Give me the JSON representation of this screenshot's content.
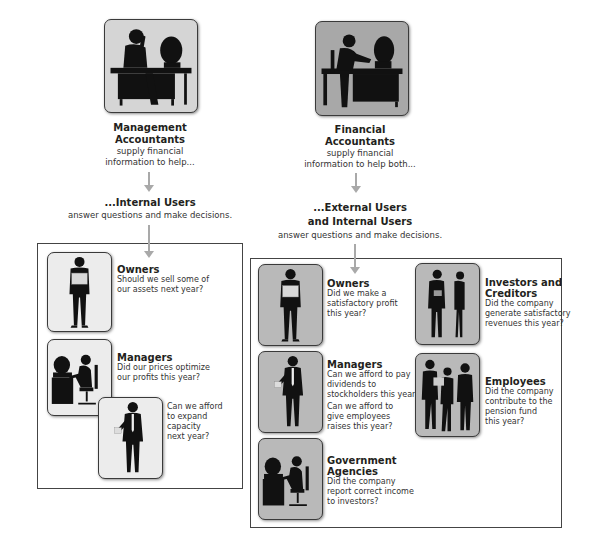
{
  "left_column": {
    "source": {
      "title_line1": "Management",
      "title_line2": "Accountants",
      "desc_line1": "supply financial",
      "desc_line2": "information to help..."
    },
    "users": {
      "title": "...Internal Users",
      "desc": "answer questions and make decisions."
    },
    "groups": [
      {
        "name": "Owners",
        "questions": [
          "Should we sell some of",
          "our assets next year?"
        ]
      },
      {
        "name": "Managers",
        "questions": [
          "Did our prices optimize",
          "our profits this year?"
        ]
      },
      {
        "name": "",
        "questions": [
          "Can we afford",
          "to expand capacity",
          "next year?"
        ]
      }
    ]
  },
  "right_column": {
    "source": {
      "title_line1": "Financial",
      "title_line2": "Accountants",
      "desc_line1": "supply financial",
      "desc_line2": "information to help both..."
    },
    "users": {
      "title_line1": "...External Users",
      "title_line2": "and Internal Users",
      "desc": "answer questions and make decisions."
    },
    "groups": [
      {
        "name": "Owners",
        "questions": [
          "Did we make a",
          "satisfactory profit",
          "this year?"
        ]
      },
      {
        "name": "Managers",
        "questions": [
          "Can we afford to pay",
          "dividends to",
          "stockholders this year?"
        ],
        "questions2": [
          "Can we afford to",
          "give employees",
          "raises this year?"
        ]
      },
      {
        "name_line1": "Government",
        "name_line2": "Agencies",
        "questions": [
          "Did the company",
          "report correct income",
          "to investors?"
        ]
      },
      {
        "name_line1": "Investors and",
        "name_line2": "Creditors",
        "questions": [
          "Did the company",
          "generate satisfactory",
          "revenues this year?"
        ]
      },
      {
        "name": "Employees",
        "questions": [
          "Did the company",
          "contribute to the",
          "pension fund",
          "this year?"
        ]
      }
    ]
  },
  "colors": {
    "tile_light": "#ececec",
    "tile_gray": "#b9b9b9",
    "arrow": "#a9a9a9",
    "silhouette": "#111111"
  }
}
